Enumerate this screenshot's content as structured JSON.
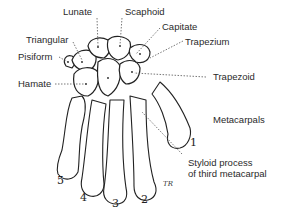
{
  "labels": {
    "lunate": "Lunate",
    "scaphoid": "Scaphoid",
    "capitate": "Capitate",
    "trapezium": "Trapezium",
    "triangular": "Triangular",
    "pisiform": "Pisiform",
    "hamate": "Hamate",
    "trapezoid": "Trapezoid",
    "metacarpals": "Metacarpals",
    "styloid_line1": "Styloid process",
    "styloid_line2": "of third metacarpal"
  },
  "metacarpal_numbers": [
    "1",
    "2",
    "3",
    "4",
    "5"
  ],
  "signature": "TR",
  "colors": {
    "ink": "#222222",
    "leader": "#555555",
    "background": "#ffffff"
  }
}
